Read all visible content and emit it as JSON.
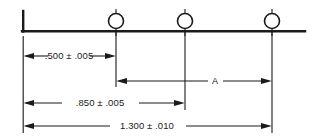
{
  "drawing": {
    "title": "Hole spacing dimensioned detail",
    "background_color": "#ffffff",
    "line_color": "#1a1a1a",
    "units_note": "inches"
  },
  "features": {
    "holes": [
      {
        "name": "hole-1",
        "cx": 116,
        "cy": 21,
        "r": 7.5
      },
      {
        "name": "hole-2",
        "cx": 185,
        "cy": 21,
        "r": 7.5
      },
      {
        "name": "hole-3",
        "cx": 272,
        "cy": 21,
        "r": 7.5
      }
    ],
    "datum_edge": {
      "x": 22,
      "y_top": 11,
      "y_base": 31,
      "x_end": 305
    }
  },
  "dimensions": [
    {
      "id": "dim-500",
      "label": ".500 ± .005",
      "nominal": ".500",
      "tolerance": "± .005",
      "from_x": 22,
      "to_x": 116,
      "y": 56,
      "text_x": 69,
      "text_y": 56
    },
    {
      "id": "dim-a",
      "label": "A",
      "nominal": "A",
      "tolerance": "",
      "from_x": 116,
      "to_x": 272,
      "y": 81,
      "text_x": 215,
      "text_y": 81
    },
    {
      "id": "dim-850",
      "label": ".850 ± .005",
      "nominal": ".850",
      "tolerance": "± .005",
      "from_x": 22,
      "to_x": 185,
      "y": 103,
      "text_x": 100,
      "text_y": 103
    },
    {
      "id": "dim-1300",
      "label": "1.300 ± .010",
      "nominal": "1.300",
      "tolerance": "± .010",
      "from_x": 22,
      "to_x": 272,
      "y": 126,
      "text_x": 147,
      "text_y": 126
    }
  ],
  "labels": {
    "dim_500": ".500 ± .005",
    "dim_a": "A",
    "dim_850": ".850 ± .005",
    "dim_1300": "1.300 ± .010"
  }
}
